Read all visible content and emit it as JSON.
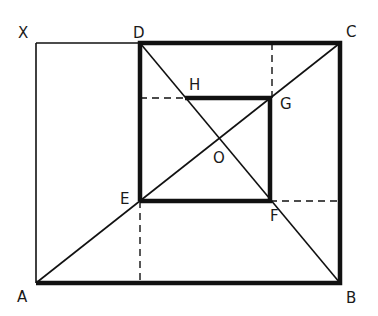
{
  "diagram": {
    "stroke_color": "#111111",
    "background": "#ffffff",
    "points": {
      "X": {
        "label": "X",
        "x": 36,
        "y": 43,
        "lx": 18,
        "ly": 38
      },
      "D": {
        "label": "D",
        "x": 140,
        "y": 43,
        "lx": 133,
        "ly": 38
      },
      "C": {
        "label": "C",
        "x": 340,
        "y": 43,
        "lx": 346,
        "ly": 37
      },
      "A": {
        "label": "A",
        "x": 36,
        "y": 283,
        "lx": 17,
        "ly": 302
      },
      "B": {
        "label": "B",
        "x": 340,
        "y": 283,
        "lx": 346,
        "ly": 303
      },
      "H": {
        "label": "H",
        "x": 185,
        "y": 98,
        "lx": 189,
        "ly": 90
      },
      "G": {
        "label": "G",
        "x": 270,
        "y": 98,
        "lx": 280,
        "ly": 109
      },
      "E": {
        "label": "E",
        "x": 140,
        "y": 201,
        "lx": 120,
        "ly": 204
      },
      "F": {
        "label": "F",
        "x": 270,
        "y": 201,
        "lx": 270,
        "ly": 221
      },
      "O": {
        "label": "O",
        "x": 218,
        "y": 146,
        "lx": 213,
        "ly": 163
      }
    },
    "thick_segments": [
      [
        "D",
        "C"
      ],
      [
        "C",
        "B"
      ],
      [
        "B",
        "A"
      ],
      [
        "D",
        "E"
      ],
      [
        "E",
        "F"
      ],
      [
        "F",
        "G"
      ],
      [
        "G",
        "H"
      ]
    ],
    "thin_segments": [
      [
        "X",
        "D"
      ],
      [
        "X",
        "A"
      ],
      [
        "A",
        "C"
      ],
      [
        "D",
        "B"
      ]
    ],
    "dashed_segments": [
      {
        "from": [
          140,
          98
        ],
        "to": [
          185,
          98
        ]
      },
      {
        "from": [
          272,
          43
        ],
        "to": [
          272,
          98
        ]
      },
      {
        "from": [
          140,
          201
        ],
        "to": [
          140,
          283
        ]
      },
      {
        "from": [
          270,
          201
        ],
        "to": [
          340,
          201
        ]
      }
    ]
  }
}
